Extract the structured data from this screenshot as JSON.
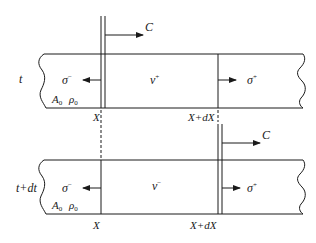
{
  "diagram": {
    "type": "wave-propagation-bar",
    "colors": {
      "stroke": "#1a1a1a",
      "background": "#ffffff"
    },
    "top_panel": {
      "time_label": "t",
      "left_stress": "σ",
      "left_stress_sup": "−",
      "velocity": "v",
      "velocity_sup": "+",
      "right_stress": "σ",
      "right_stress_sup": "+",
      "area": "A",
      "area_sub": "0",
      "density": "ρ",
      "density_sub": "0",
      "wavefront_label": "C",
      "section_left": "X",
      "section_right": "X+dX"
    },
    "bottom_panel": {
      "time_label": "t+dt",
      "left_stress": "σ",
      "left_stress_sup": "−",
      "velocity": "v",
      "velocity_sup": "−",
      "right_stress": "σ",
      "right_stress_sup": "+",
      "area": "A",
      "area_sub": "0",
      "density": "ρ",
      "density_sub": "0",
      "wavefront_label": "C",
      "section_left": "X",
      "section_right": "X+dX"
    }
  }
}
